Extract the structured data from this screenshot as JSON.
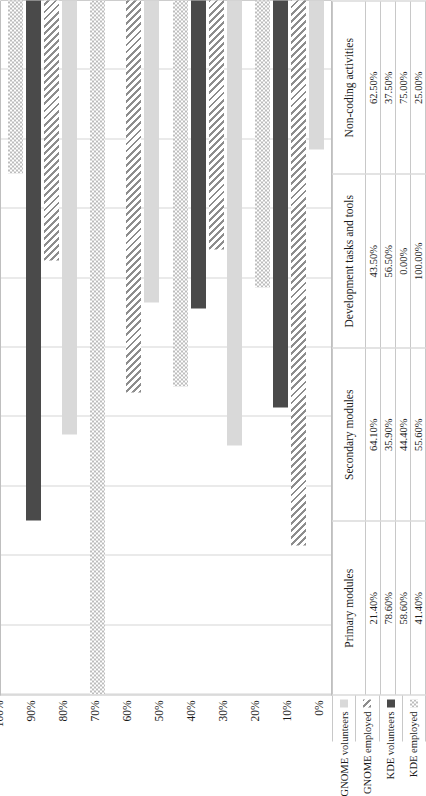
{
  "chart_data": {
    "type": "bar",
    "orientation": "horizontal",
    "title": "",
    "xlabel": "",
    "ylabel": "",
    "ylim": [
      0,
      100
    ],
    "grid": true,
    "legend_position": "left-table",
    "tick_labels": [
      "0%",
      "10%",
      "20%",
      "30%",
      "40%",
      "50%",
      "60%",
      "70%",
      "80%",
      "90%",
      "100%"
    ],
    "categories": [
      "Primary modules",
      "Secondary modules",
      "Development tasks and tools",
      "Non-coding activities"
    ],
    "series": [
      {
        "name": "GNOME volunteers",
        "fill": "f-gv",
        "swatch": "light-gray-solid",
        "values": [
          21.4,
          64.1,
          43.5,
          62.5
        ],
        "labels": [
          "21.40%",
          "64.10%",
          "43.50%",
          "62.50%"
        ]
      },
      {
        "name": "GNOME employed",
        "fill": "f-ge",
        "swatch": "diagonal-hatch",
        "values": [
          78.6,
          35.9,
          56.5,
          37.5
        ],
        "labels": [
          "78.60%",
          "35.90%",
          "56.50%",
          "37.50%"
        ]
      },
      {
        "name": "KDE volunteers",
        "fill": "f-kv",
        "swatch": "dark-gray-solid",
        "values": [
          58.6,
          44.4,
          0.0,
          75.0
        ],
        "labels": [
          "58.60%",
          "44.40%",
          "0.00%",
          "75.00%"
        ]
      },
      {
        "name": "KDE employed",
        "fill": "f-ke",
        "swatch": "checkerboard",
        "values": [
          41.4,
          55.6,
          100.0,
          25.0
        ],
        "labels": [
          "41.40%",
          "55.60%",
          "100.00%",
          "25.00%"
        ]
      }
    ]
  },
  "colors": {
    "gnome_volunteers": "#d9d9d9",
    "gnome_employed": "#8d8d8d",
    "kde_volunteers": "#4a4a4a",
    "kde_employed": "#bdbdbd",
    "grid": "#d5d5d5",
    "axis": "#9a9a9a"
  }
}
